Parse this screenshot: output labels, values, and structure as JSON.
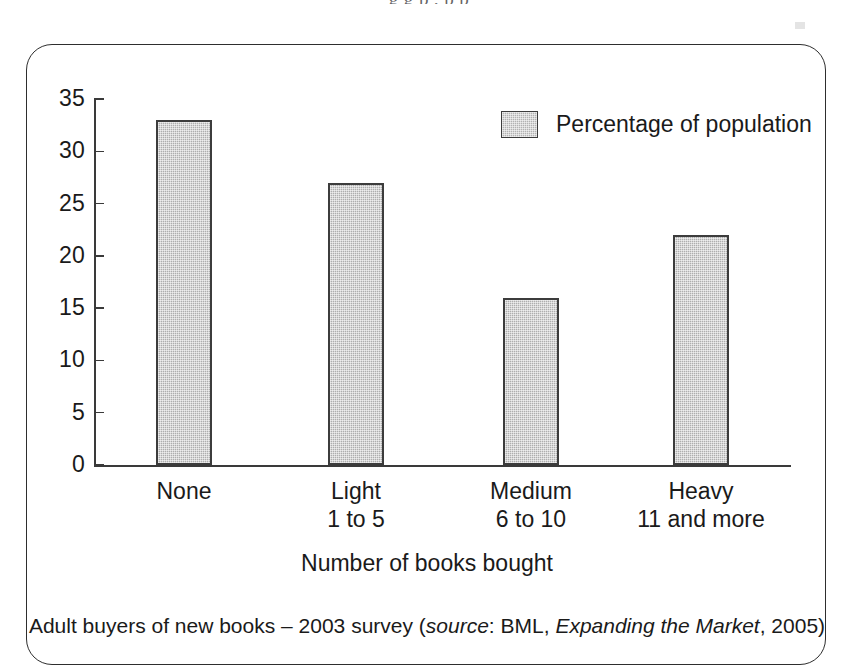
{
  "page": {
    "top_bleed_text": "g   g   p          ,  p           p",
    "background_color": "#ffffff"
  },
  "figure": {
    "frame": {
      "border_color": "#2e2e2e",
      "corner_radius_px": 26
    },
    "axis_title": "Number of books bought",
    "caption": {
      "part1": "Adult buyers of new books – 2003 survey (",
      "italic1": "source",
      "part2": ": BML, ",
      "italic2": "Expanding the Market",
      "part3": ", 2005)"
    }
  },
  "chart_data": {
    "type": "bar",
    "title": "",
    "categories": [
      "None",
      "Light",
      "Medium",
      "Heavy"
    ],
    "category_sublabels": [
      "",
      "1 to 5",
      "6 to 10",
      "11 and more"
    ],
    "values": [
      33,
      27,
      16,
      22
    ],
    "series": [
      {
        "name": "Percentage of population",
        "values": [
          33,
          27,
          16,
          22
        ]
      }
    ],
    "legend": [
      "Percentage of population"
    ],
    "legend_position": "top-right",
    "xlabel": "Number of books bought",
    "ylabel": "",
    "ylim": [
      0,
      35
    ],
    "ytick_labels": [
      "35",
      "30",
      "25",
      "20",
      "15",
      "10",
      "5",
      "0"
    ],
    "ytick_values": [
      35,
      30,
      25,
      20,
      15,
      10,
      5,
      0
    ],
    "grid": false,
    "bar_fill_color": "#aeaeae",
    "bar_border_color": "#3c3c3c",
    "axis_color": "#3a3a3a"
  }
}
